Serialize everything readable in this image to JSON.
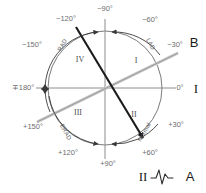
{
  "figure": {
    "center": {
      "x": 105,
      "y": 88
    },
    "radius": 57,
    "colors": {
      "circle": "#7a7a7a",
      "axis": "#8c8c8c",
      "vector_dark": "#1a1a1a",
      "vector_gray": "#b6b6b6",
      "degree_text": "#6e6e6e",
      "quadrant_text": "#4d4d4d",
      "background": "#ffffff"
    }
  },
  "degree_labels": [
    {
      "text": "−90°",
      "x": 105,
      "y": 11,
      "anchor": "middle"
    },
    {
      "text": "−60°",
      "x": 150,
      "y": 22,
      "anchor": "middle"
    },
    {
      "text": "−30°",
      "x": 175,
      "y": 47,
      "anchor": "middle"
    },
    {
      "text": "0°",
      "x": 180,
      "y": 90,
      "anchor": "middle"
    },
    {
      "text": "+30°",
      "x": 176,
      "y": 127,
      "anchor": "middle"
    },
    {
      "text": "+60°",
      "x": 150,
      "y": 155,
      "anchor": "middle"
    },
    {
      "text": "+90°",
      "x": 108,
      "y": 166,
      "anchor": "middle"
    },
    {
      "text": "+120°",
      "x": 68,
      "y": 155,
      "anchor": "middle"
    },
    {
      "text": "+150°",
      "x": 33,
      "y": 129,
      "anchor": "middle"
    },
    {
      "text": "∓180°",
      "x": 23,
      "y": 90,
      "anchor": "middle"
    },
    {
      "text": "−150°",
      "x": 32,
      "y": 47,
      "anchor": "middle"
    },
    {
      "text": "−120°",
      "x": 66,
      "y": 21,
      "anchor": "middle"
    }
  ],
  "quadrant_labels": [
    {
      "text": "I",
      "x": 136,
      "y": 63
    },
    {
      "text": "II",
      "x": 134,
      "y": 117
    },
    {
      "text": "III",
      "x": 78,
      "y": 115
    },
    {
      "text": "IV",
      "x": 80,
      "y": 62
    }
  ],
  "axis_region_labels": [
    {
      "text": "RAD",
      "x": 64,
      "y": 46,
      "rotate": -60
    },
    {
      "text": "LAD",
      "x": 149,
      "y": 45,
      "rotate": 60
    },
    {
      "text": "Normal",
      "x": 146,
      "y": 133,
      "rotate": -60
    },
    {
      "text": "ERAD",
      "x": 64,
      "y": 133,
      "rotate": 60
    }
  ],
  "markers": [
    {
      "id": "marker-b",
      "letter": "B",
      "x": 194,
      "y": 47,
      "ref_degree": "−30°"
    },
    {
      "id": "marker-a",
      "letter": "A",
      "x": 190,
      "y": 180,
      "ref_degree": "+60°"
    }
  ],
  "leads": [
    {
      "id": "lead-one",
      "label": "I",
      "x": 196,
      "y": 92,
      "degree": "0°"
    },
    {
      "id": "lead-two",
      "label": "II",
      "x": 143,
      "y": 180,
      "degree": "+60°"
    }
  ],
  "vectors": [
    {
      "id": "dark-vector",
      "color": "#1a1a1a",
      "description": "Mean QRS axis at +60 degrees (lead II direction)",
      "from_degree": "−120°",
      "to_degree": "+60°",
      "x1": 76,
      "y1": 27,
      "x2": 146,
      "y2": 143
    },
    {
      "id": "gray-vector",
      "color": "#b6b6b6",
      "description": "Reference axis at -30 degrees",
      "from_degree": "+150°",
      "to_degree": "−30°",
      "x1": 37,
      "y1": 122,
      "x2": 178,
      "y2": 53
    }
  ],
  "ecg_glyph": {
    "name": "ecg-waveform-icon",
    "x": 160,
    "y": 178,
    "description": "small QRS complex waveform"
  }
}
